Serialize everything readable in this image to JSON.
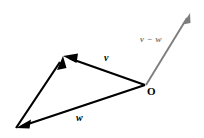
{
  "figure": {
    "background_color": "#ffffff",
    "width": 204,
    "height": 138,
    "labels": {
      "v": "v",
      "w": "w",
      "v_minus_w": "v − w",
      "origin": "O"
    },
    "colors": {
      "vector_black": "#000000",
      "vector_gray": "#7d7d7d",
      "label_black": "#000000",
      "label_gray": "#7d7d7d"
    },
    "vectors": [
      {
        "name": "v",
        "label": "v",
        "color": "#000000",
        "from": [
          145,
          85
        ],
        "to": [
          63,
          56
        ],
        "arrow_at": "to"
      },
      {
        "name": "w",
        "label": "w",
        "color": "#000000",
        "from": [
          145,
          85
        ],
        "to": [
          16,
          128
        ],
        "arrow_at": "to"
      },
      {
        "name": "side",
        "label": "",
        "color": "#000000",
        "from": [
          16,
          128
        ],
        "to": [
          63,
          56
        ],
        "arrow_at": "to"
      },
      {
        "name": "v-minus-w",
        "label": "v − w",
        "color": "#7d7d7d",
        "from": [
          146,
          85
        ],
        "to": [
          190,
          13
        ],
        "arrow_at": "to"
      }
    ],
    "points": [
      {
        "name": "origin",
        "label": "O",
        "at": [
          145,
          85
        ]
      },
      {
        "name": "apex",
        "label": "",
        "at": [
          63,
          56
        ]
      },
      {
        "name": "bottom-left",
        "label": "",
        "at": [
          16,
          128
        ]
      }
    ]
  }
}
